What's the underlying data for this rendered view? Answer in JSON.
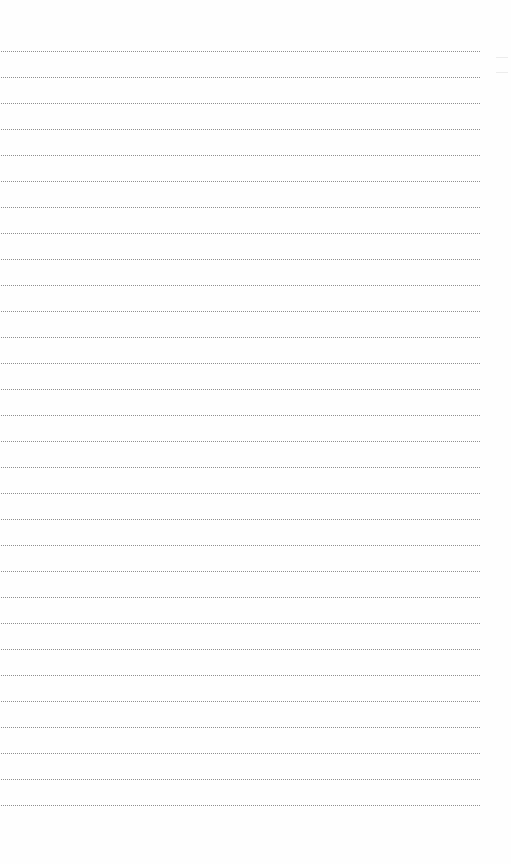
{
  "page": {
    "type": "ruled-notebook-page",
    "background_color": "#fefefe",
    "line_style": "dotted",
    "line_color": "#8f8f8f",
    "line_count": 30,
    "first_line_y": 51,
    "line_spacing": 26,
    "line_left": 1,
    "line_width": 479
  }
}
